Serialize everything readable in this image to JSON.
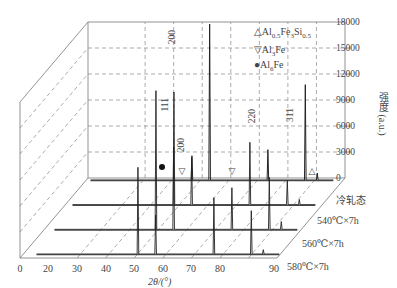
{
  "chart_data": {
    "type": "line",
    "subtype": "3d-waterfall-xrd",
    "title": "",
    "xlabel": "2θ/(°)",
    "ylabel": "强度 (a.u.)",
    "xlim": [
      0,
      90
    ],
    "ylim": [
      0,
      18000
    ],
    "x_ticks": [
      "0",
      "20",
      "30",
      "40",
      "50",
      "60",
      "70",
      "80",
      "90"
    ],
    "y_ticks": [
      "0",
      "3000",
      "6000",
      "9000",
      "12000",
      "15000",
      "18000"
    ],
    "grid": true,
    "legend": [
      {
        "symbol": "△",
        "label": "Al0.5Fe3Si0.5",
        "phase": "Al0.5Fe3Si0.5"
      },
      {
        "symbol": "▽",
        "label": "Al3Fe",
        "phase": "Al3Fe"
      },
      {
        "symbol": "●",
        "label": "Al6Fe",
        "phase": "Al6Fe"
      }
    ],
    "peak_labels": [
      "111",
      "200",
      "200",
      "220",
      "311"
    ],
    "series": [
      {
        "name": "冷轧态",
        "peaks": [
          {
            "x": 38.5,
            "y": 2800
          },
          {
            "x": 44.7,
            "y": 18000
          },
          {
            "x": 65.1,
            "y": 3500
          },
          {
            "x": 78.2,
            "y": 11000
          },
          {
            "x": 82.4,
            "y": 800
          }
        ]
      },
      {
        "name": "540℃×7h",
        "peaks": [
          {
            "x": 38.5,
            "y": 13000
          },
          {
            "x": 44.7,
            "y": 5400
          },
          {
            "x": 65.1,
            "y": 7200
          },
          {
            "x": 78.2,
            "y": 2800
          },
          {
            "x": 82.4,
            "y": 600
          }
        ]
      },
      {
        "name": "560℃×7h",
        "peaks": [
          {
            "x": 38.5,
            "y": 16000
          },
          {
            "x": 44.7,
            "y": 9500
          },
          {
            "x": 65.1,
            "y": 4800
          },
          {
            "x": 78.2,
            "y": 6000
          },
          {
            "x": 82.4,
            "y": 900
          }
        ]
      },
      {
        "name": "580℃×7h",
        "peaks": [
          {
            "x": 38.5,
            "y": 10000
          },
          {
            "x": 44.7,
            "y": 4500
          },
          {
            "x": 65.1,
            "y": 6500
          },
          {
            "x": 78.2,
            "y": 5000
          },
          {
            "x": 82.4,
            "y": 500
          }
        ]
      }
    ]
  },
  "axes": {
    "xlabel": "2θ/(°)",
    "ylabel": "强度 (a.u.)",
    "x_ticks": [
      "0",
      "20",
      "30",
      "40",
      "50",
      "60",
      "70",
      "80",
      "90"
    ],
    "y_ticks": [
      "18000",
      "15000",
      "12000",
      "9000",
      "6000",
      "3000",
      "0"
    ]
  },
  "legend": {
    "item0": "△Al0.5Fe3Si0.5",
    "item1": "▽Al3Fe",
    "item2": "●Al6Fe"
  },
  "series_labels": [
    "冷轧态",
    "540℃×7h",
    "560℃×7h",
    "580℃×7h"
  ],
  "peaks": {
    "p111": "111",
    "p200a": "200",
    "p200b": "200",
    "p220": "220",
    "p311": "311"
  }
}
